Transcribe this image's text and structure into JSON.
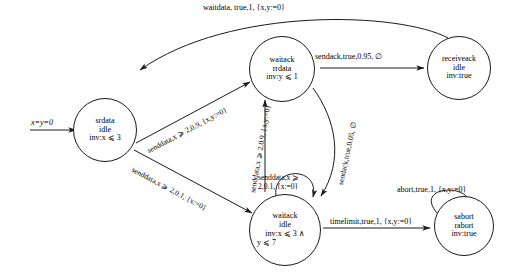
{
  "diagram": {
    "kind": "probabilistic-timed-automaton",
    "stroke_color": "#1a1a1a",
    "text_color": "#000000",
    "background": "#ffffff"
  },
  "init": {
    "label": "x=y=0"
  },
  "states": [
    {
      "id": "srdata",
      "line1": "srdata",
      "line2": "idle",
      "line3": "inv:x ⩽ 3"
    },
    {
      "id": "waitack-rrdata",
      "line1": "waitack",
      "line2": "rrdata",
      "line3": "inv:y ⩽ 1"
    },
    {
      "id": "receiveack",
      "line1": "receiveack",
      "line2": "idle",
      "line3": "inv:true"
    },
    {
      "id": "waitack-idle",
      "line1": "waitack",
      "line2": "idle",
      "line3": "inv:x ⩽ 3 ∧",
      "line4": "y ⩽ 7"
    },
    {
      "id": "sabort",
      "line1": "sabort",
      "line2": "rabort",
      "line3": "inv:true"
    }
  ],
  "transitions": [
    {
      "id": "waitdata",
      "label": "waitdata, true,1, {x,y:=0}",
      "from": "receiveack",
      "to": "srdata"
    },
    {
      "id": "senddata-09-top",
      "label": "senddata,x ⩾ 2,0.9, {x,y:=0}",
      "from": "srdata",
      "to": "waitack-rrdata"
    },
    {
      "id": "senddata-01",
      "label": "senddata,x ⩾ 2,0.1, {x:=0}",
      "from": "srdata",
      "to": "waitack-idle"
    },
    {
      "id": "sendack-095",
      "label": "sendack,true,0.95, ∅",
      "from": "waitack-rrdata",
      "to": "receiveack"
    },
    {
      "id": "sendack-005",
      "label": "sendack,true,0.05, ∅",
      "from": "waitack-rrdata",
      "to": "waitack-idle"
    },
    {
      "id": "senddata-09-vert",
      "label": "senddata,x ⩾ 2,0.9, {x,y:=0}",
      "from": "waitack-idle",
      "to": "waitack-rrdata"
    },
    {
      "id": "senddata-self",
      "label_line1": "senddata,x ⩾",
      "label_line2": "2,0.1, {x:=0}",
      "from": "waitack-idle",
      "to": "waitack-idle"
    },
    {
      "id": "timelimit",
      "label": "timelimit,true,1, {x,y:=0}",
      "from": "waitack-idle",
      "to": "sabort"
    },
    {
      "id": "abort-self",
      "label": "abort,true,1, {x,y:=0}",
      "from": "sabort",
      "to": "sabort"
    }
  ]
}
